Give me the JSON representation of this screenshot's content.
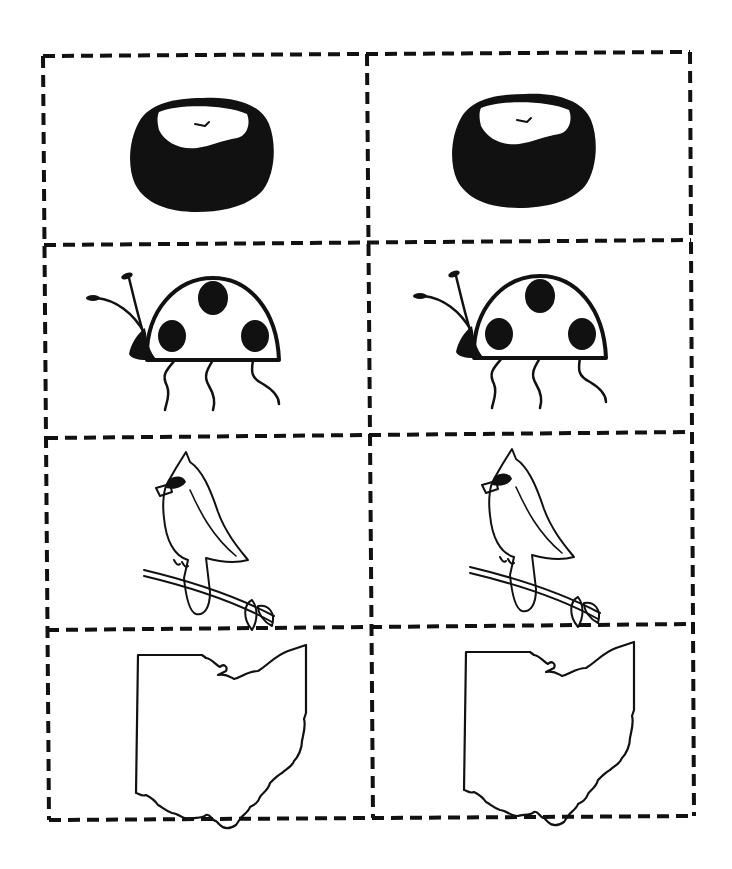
{
  "page": {
    "layout": {
      "rows": 4,
      "columns": 2,
      "border_style": "dashed cut lines",
      "ink_color": "#111111",
      "background": "#ffffff"
    }
  },
  "cards": [
    {
      "row": 1,
      "col": 1,
      "picture": "buckeye-nut"
    },
    {
      "row": 1,
      "col": 2,
      "picture": "buckeye-nut"
    },
    {
      "row": 2,
      "col": 1,
      "picture": "ladybug"
    },
    {
      "row": 2,
      "col": 2,
      "picture": "ladybug"
    },
    {
      "row": 3,
      "col": 1,
      "picture": "cardinal-on-branch"
    },
    {
      "row": 3,
      "col": 2,
      "picture": "cardinal-on-branch"
    },
    {
      "row": 4,
      "col": 1,
      "picture": "ohio-state-outline"
    },
    {
      "row": 4,
      "col": 2,
      "picture": "ohio-state-outline"
    }
  ]
}
